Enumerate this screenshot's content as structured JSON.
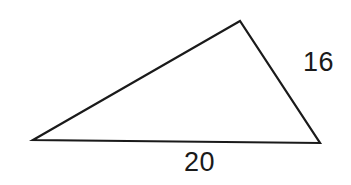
{
  "diagram": {
    "type": "triangle",
    "vertices": {
      "left": [
        33,
        140
      ],
      "top": [
        240,
        21
      ],
      "right": [
        320,
        143
      ]
    },
    "stroke_color": "#1a1a1a",
    "background_color": "#ffffff",
    "labels": {
      "right_side": "16",
      "bottom_side": "20"
    }
  }
}
